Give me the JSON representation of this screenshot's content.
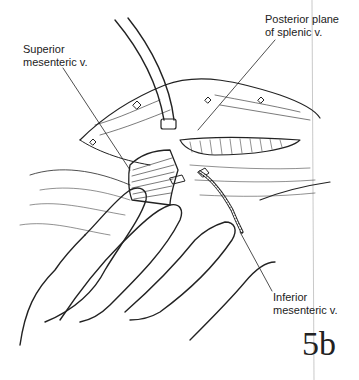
{
  "figure": {
    "number": "5b",
    "labels": {
      "superior_mesenteric": [
        "Superior",
        "mesenteric v."
      ],
      "posterior_plane": [
        "Posterior plane",
        "of splenic v."
      ],
      "inferior_mesenteric": [
        "Inferior",
        "mesenteric v."
      ]
    }
  }
}
